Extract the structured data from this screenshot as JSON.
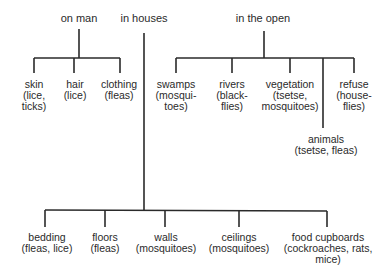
{
  "diagram": {
    "categories": {
      "on_man": "on man",
      "in_houses": "in houses",
      "in_the_open": "in the open"
    },
    "on_man": [
      {
        "place": "skin",
        "l2": "(lice,",
        "l3": "ticks)"
      },
      {
        "place": "hair",
        "l2": "(lice)",
        "l3": ""
      },
      {
        "place": "clothing",
        "l2": "(fleas)",
        "l3": ""
      }
    ],
    "in_the_open": [
      {
        "place": "swamps",
        "l2": "(mosqui-",
        "l3": "toes)"
      },
      {
        "place": "rivers",
        "l2": "(black-",
        "l3": "flies)"
      },
      {
        "place": "vegetation",
        "l2": "(tsetse,",
        "l3": "mosquitoes)"
      },
      {
        "place": "refuse",
        "l2": "(house-",
        "l3": "flies)"
      },
      {
        "place": "animals",
        "l2": "(tsetse, fleas)",
        "l3": ""
      }
    ],
    "in_houses": [
      {
        "place": "bedding",
        "l2": "(fleas, lice)",
        "l3": ""
      },
      {
        "place": "floors",
        "l2": "(fleas)",
        "l3": ""
      },
      {
        "place": "walls",
        "l2": "(mosquitoes)",
        "l3": ""
      },
      {
        "place": "ceilings",
        "l2": "(mosquitoes)",
        "l3": ""
      },
      {
        "place": "food cupboards",
        "l2": "(cockroaches, rats,",
        "l3": "mice)"
      }
    ]
  }
}
